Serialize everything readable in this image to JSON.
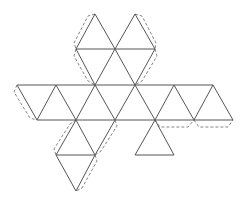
{
  "diagram": {
    "colors": {
      "edge": "#555555",
      "tab": "#777777",
      "background": "#ffffff"
    },
    "edges": [
      [
        95,
        14,
        76,
        49
      ],
      [
        95,
        14,
        115,
        49
      ],
      [
        135,
        14,
        115,
        49
      ],
      [
        135,
        14,
        155,
        49
      ],
      [
        76,
        49,
        155,
        49
      ],
      [
        76,
        49,
        95,
        85
      ],
      [
        115,
        49,
        95,
        85
      ],
      [
        115,
        49,
        135,
        85
      ],
      [
        155,
        49,
        135,
        85
      ],
      [
        17,
        85,
        213,
        85
      ],
      [
        17,
        85,
        37,
        120
      ],
      [
        56,
        85,
        37,
        120
      ],
      [
        56,
        85,
        76,
        120
      ],
      [
        95,
        85,
        76,
        120
      ],
      [
        95,
        85,
        115,
        120
      ],
      [
        135,
        85,
        115,
        120
      ],
      [
        135,
        85,
        155,
        120
      ],
      [
        174,
        85,
        155,
        120
      ],
      [
        174,
        85,
        194,
        120
      ],
      [
        213,
        85,
        194,
        120
      ],
      [
        213,
        85,
        233,
        120
      ],
      [
        37,
        120,
        233,
        120
      ],
      [
        76,
        120,
        56,
        155
      ],
      [
        76,
        120,
        95,
        155
      ],
      [
        115,
        120,
        95,
        155
      ],
      [
        155,
        120,
        135,
        155
      ],
      [
        155,
        120,
        174,
        155
      ],
      [
        56,
        155,
        95,
        155
      ],
      [
        135,
        155,
        174,
        155
      ],
      [
        56,
        155,
        76,
        191
      ],
      [
        95,
        155,
        76,
        191
      ]
    ],
    "tabs": [
      "M95,14 L88,16 L74,43 L76,49",
      "M135,14 L142,16 L156,43 L155,49",
      "M76,49 L74,56 L88,81 L95,85",
      "M155,49 L157,56 L142,81 L135,85",
      "M17,85 L14,92 L30,118 L37,120",
      "M76,120 L70,124 L54,149 L56,155",
      "M95,155 L97,161 L82,188 L76,191",
      "M115,120 L117,126 L101,151 L95,155",
      "M155,120 L160,127 L188,127 L194,120",
      "M194,120 L199,127 L228,127 L233,120"
    ]
  }
}
